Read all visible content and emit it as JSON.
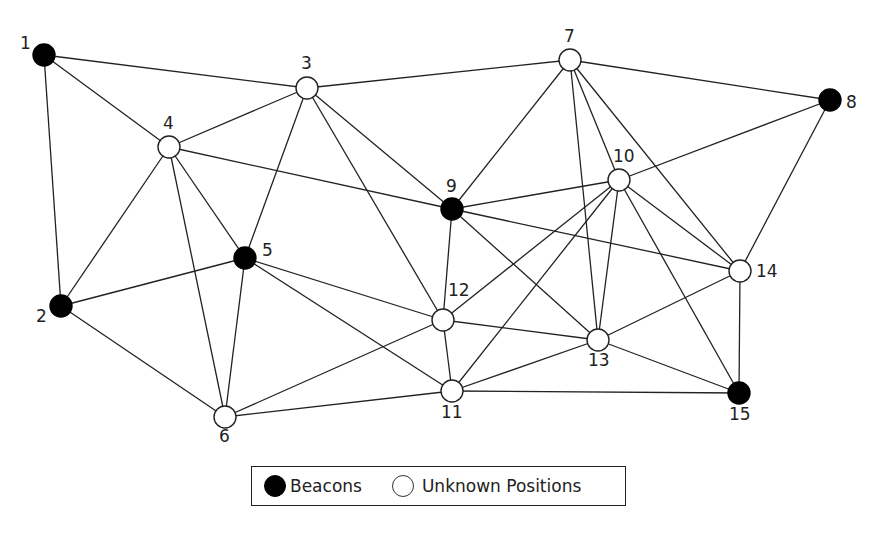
{
  "diagram": {
    "type": "network-graph",
    "colors": {
      "beacon": "#000000",
      "unknown": "#ffffff",
      "edge": "#222222"
    },
    "nodes": [
      {
        "id": "1",
        "x": 44,
        "y": 55,
        "kind": "beacon",
        "lx": 20,
        "ly": 49
      },
      {
        "id": "2",
        "x": 61,
        "y": 306,
        "kind": "beacon",
        "lx": 36,
        "ly": 322
      },
      {
        "id": "3",
        "x": 307,
        "y": 88,
        "kind": "unknown",
        "lx": 301,
        "ly": 69
      },
      {
        "id": "4",
        "x": 169,
        "y": 147,
        "kind": "unknown",
        "lx": 163,
        "ly": 129
      },
      {
        "id": "5",
        "x": 245,
        "y": 258,
        "kind": "beacon",
        "lx": 262,
        "ly": 256
      },
      {
        "id": "6",
        "x": 225,
        "y": 417,
        "kind": "unknown",
        "lx": 219,
        "ly": 442
      },
      {
        "id": "7",
        "x": 570,
        "y": 60,
        "kind": "unknown",
        "lx": 564,
        "ly": 42
      },
      {
        "id": "8",
        "x": 830,
        "y": 100,
        "kind": "beacon",
        "lx": 846,
        "ly": 108
      },
      {
        "id": "9",
        "x": 452,
        "y": 209,
        "kind": "beacon",
        "lx": 446,
        "ly": 192
      },
      {
        "id": "10",
        "x": 619,
        "y": 180,
        "kind": "unknown",
        "lx": 613,
        "ly": 162
      },
      {
        "id": "11",
        "x": 452,
        "y": 391,
        "kind": "unknown",
        "lx": 441,
        "ly": 418
      },
      {
        "id": "12",
        "x": 443,
        "y": 320,
        "kind": "unknown",
        "lx": 448,
        "ly": 296
      },
      {
        "id": "13",
        "x": 598,
        "y": 340,
        "kind": "unknown",
        "lx": 588,
        "ly": 366
      },
      {
        "id": "14",
        "x": 740,
        "y": 271,
        "kind": "unknown",
        "lx": 756,
        "ly": 277
      },
      {
        "id": "15",
        "x": 739,
        "y": 393,
        "kind": "beacon",
        "lx": 729,
        "ly": 420
      }
    ],
    "edges": [
      [
        "1",
        "3"
      ],
      [
        "1",
        "4"
      ],
      [
        "1",
        "2"
      ],
      [
        "3",
        "4"
      ],
      [
        "3",
        "7"
      ],
      [
        "3",
        "5"
      ],
      [
        "3",
        "9"
      ],
      [
        "3",
        "12"
      ],
      [
        "4",
        "9"
      ],
      [
        "4",
        "2"
      ],
      [
        "4",
        "6"
      ],
      [
        "4",
        "5"
      ],
      [
        "2",
        "5"
      ],
      [
        "2",
        "6"
      ],
      [
        "5",
        "6"
      ],
      [
        "5",
        "12"
      ],
      [
        "5",
        "11"
      ],
      [
        "6",
        "12"
      ],
      [
        "6",
        "11"
      ],
      [
        "7",
        "8"
      ],
      [
        "7",
        "9"
      ],
      [
        "7",
        "13"
      ],
      [
        "7",
        "10"
      ],
      [
        "7",
        "14"
      ],
      [
        "8",
        "10"
      ],
      [
        "8",
        "14"
      ],
      [
        "9",
        "10"
      ],
      [
        "9",
        "12"
      ],
      [
        "9",
        "14"
      ],
      [
        "9",
        "13"
      ],
      [
        "10",
        "12"
      ],
      [
        "10",
        "11"
      ],
      [
        "10",
        "13"
      ],
      [
        "10",
        "14"
      ],
      [
        "10",
        "15"
      ],
      [
        "12",
        "11"
      ],
      [
        "12",
        "13"
      ],
      [
        "11",
        "13"
      ],
      [
        "11",
        "15"
      ],
      [
        "13",
        "14"
      ],
      [
        "13",
        "15"
      ],
      [
        "14",
        "15"
      ]
    ]
  },
  "legend": {
    "beacon_label": "Beacons",
    "unknown_label": "Unknown Positions"
  }
}
